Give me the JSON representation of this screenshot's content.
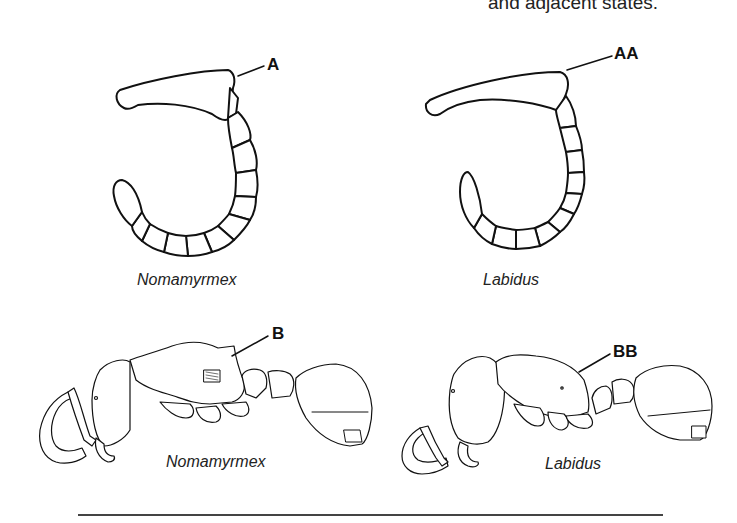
{
  "caption_fragment": "and adjacent states.",
  "figures": {
    "antenna_left": {
      "genus": "Nomamyrmex",
      "callout": "A"
    },
    "antenna_right": {
      "genus": "Labidus",
      "callout": "AA"
    },
    "body_left": {
      "genus": "Nomamyrmex",
      "callout": "B"
    },
    "body_right": {
      "genus": "Labidus",
      "callout": "BB"
    }
  }
}
